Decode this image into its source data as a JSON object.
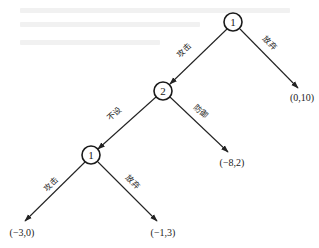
{
  "diagram": {
    "type": "game-tree",
    "colors": {
      "line": "#222222",
      "background": "#ffffff",
      "bleed_through": "#f1f1f1"
    },
    "nodes": [
      {
        "id": "n1",
        "label": "1",
        "cx": 233,
        "cy": 22,
        "r": 9
      },
      {
        "id": "n2",
        "label": "2",
        "cx": 163,
        "cy": 91,
        "r": 9
      },
      {
        "id": "n3",
        "label": "1",
        "cx": 91,
        "cy": 155,
        "r": 9
      }
    ],
    "edges": [
      {
        "id": "e1",
        "from": "n1",
        "to": "n2",
        "label": "攻击",
        "x1": 227,
        "y1": 29,
        "x2": 170,
        "y2": 84,
        "lx": 186,
        "ly": 52,
        "angle": -44
      },
      {
        "id": "e2",
        "from": "n1",
        "to": "t1",
        "label": "放弃",
        "x1": 240,
        "y1": 29,
        "x2": 298,
        "y2": 88,
        "lx": 268,
        "ly": 45,
        "angle": 45
      },
      {
        "id": "e3",
        "from": "n2",
        "to": "n3",
        "label": "不设",
        "x1": 156,
        "y1": 97,
        "x2": 98,
        "y2": 149,
        "lx": 116,
        "ly": 116,
        "angle": -42
      },
      {
        "id": "e4",
        "from": "n2",
        "to": "t2",
        "label": "防御",
        "x1": 170,
        "y1": 97,
        "x2": 228,
        "y2": 152,
        "lx": 199,
        "ly": 113,
        "angle": 43
      },
      {
        "id": "e5",
        "from": "n3",
        "to": "t3",
        "label": "攻击",
        "x1": 85,
        "y1": 162,
        "x2": 25,
        "y2": 221,
        "lx": 53,
        "ly": 186,
        "angle": -45
      },
      {
        "id": "e6",
        "from": "n3",
        "to": "t4",
        "label": "放弃",
        "x1": 98,
        "y1": 162,
        "x2": 157,
        "y2": 221,
        "lx": 131,
        "ly": 184,
        "angle": 45
      }
    ],
    "terminals": [
      {
        "id": "t1",
        "payoff": "(0,10)",
        "x": 302,
        "y": 101
      },
      {
        "id": "t2",
        "payoff": "(−8,2)",
        "x": 232,
        "y": 166
      },
      {
        "id": "t3",
        "payoff": "(−3,0)",
        "x": 22,
        "y": 236
      },
      {
        "id": "t4",
        "payoff": "(−1,3)",
        "x": 163,
        "y": 236
      }
    ]
  }
}
